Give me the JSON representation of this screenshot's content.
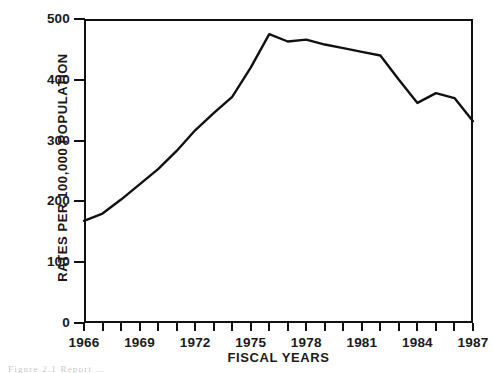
{
  "chart_data": {
    "type": "line",
    "title": "",
    "xlabel": "FISCAL YEARS",
    "ylabel": "RATES PER 100,000 POPULATION",
    "x": [
      1966,
      1967,
      1968,
      1969,
      1970,
      1971,
      1972,
      1973,
      1974,
      1975,
      1976,
      1977,
      1978,
      1979,
      1980,
      1981,
      1982,
      1983,
      1984,
      1985,
      1986,
      1987
    ],
    "values": [
      168,
      180,
      203,
      228,
      253,
      283,
      317,
      345,
      372,
      420,
      475,
      463,
      466,
      458,
      452,
      446,
      440,
      400,
      362,
      378,
      370,
      332
    ],
    "categories": [
      "1966",
      "1967",
      "1968",
      "1969",
      "1970",
      "1971",
      "1972",
      "1973",
      "1974",
      "1975",
      "1976",
      "1977",
      "1978",
      "1979",
      "1980",
      "1981",
      "1982",
      "1983",
      "1984",
      "1985",
      "1986",
      "1987"
    ],
    "ylim": [
      0,
      500
    ],
    "xlim": [
      1966,
      1987
    ],
    "ytick_values": [
      0,
      100,
      200,
      300,
      400,
      500
    ],
    "ytick_labels": [
      "0",
      "100",
      "200",
      "300",
      "400",
      "500"
    ],
    "xtick_values": [
      1966,
      1967,
      1968,
      1969,
      1970,
      1971,
      1972,
      1973,
      1974,
      1975,
      1976,
      1977,
      1978,
      1979,
      1980,
      1981,
      1982,
      1983,
      1984,
      1985,
      1986,
      1987
    ],
    "xtick_labels_shown": [
      "1966",
      "1969",
      "1972",
      "1975",
      "1978",
      "1981",
      "1984",
      "1987"
    ],
    "grid": false,
    "legend": false,
    "line_color": "#111111",
    "line_width": 2.4,
    "markers": false,
    "background": "#ffffff",
    "axis_color": "#111111"
  },
  "caption": {
    "text": "Figure 2.1  Report ...",
    "visible_fragment": "cropped"
  }
}
